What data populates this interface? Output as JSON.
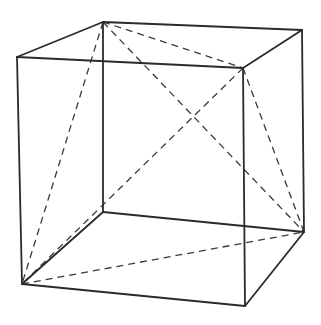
{
  "diagram": {
    "type": "cube-with-inscribed-tetrahedron",
    "colors": {
      "edge": "#2b2b2b",
      "diagonal": "#3a3a3a",
      "background": "#ffffff"
    },
    "vertices": {
      "TFL": [
        17,
        57
      ],
      "TFR": [
        243,
        68
      ],
      "TBL": [
        103,
        22
      ],
      "TBR": [
        302,
        30
      ],
      "BFL": [
        22,
        284
      ],
      "BFR": [
        245,
        306
      ],
      "BBL": [
        103,
        212
      ],
      "BBR": [
        304,
        232
      ]
    },
    "solid_edges": [
      [
        "TFL",
        "TFR"
      ],
      [
        "TFR",
        "TBR"
      ],
      [
        "TBR",
        "TBL"
      ],
      [
        "TBL",
        "TFL"
      ],
      [
        "BFL",
        "BFR"
      ],
      [
        "BFR",
        "BBR"
      ],
      [
        "BBR",
        "BBL"
      ],
      [
        "BBL",
        "BFL"
      ],
      [
        "TFL",
        "BFL"
      ],
      [
        "TFR",
        "BFR"
      ],
      [
        "TBR",
        "BBR"
      ],
      [
        "TBL",
        "BBL"
      ]
    ],
    "dashed_edges": [
      [
        "TBL",
        "TFR"
      ],
      [
        "TBL",
        "BBR"
      ],
      [
        "TBL",
        "BFL"
      ],
      [
        "TFR",
        "BFL"
      ],
      [
        "TFR",
        "BBR"
      ],
      [
        "BFL",
        "BBR"
      ]
    ]
  }
}
